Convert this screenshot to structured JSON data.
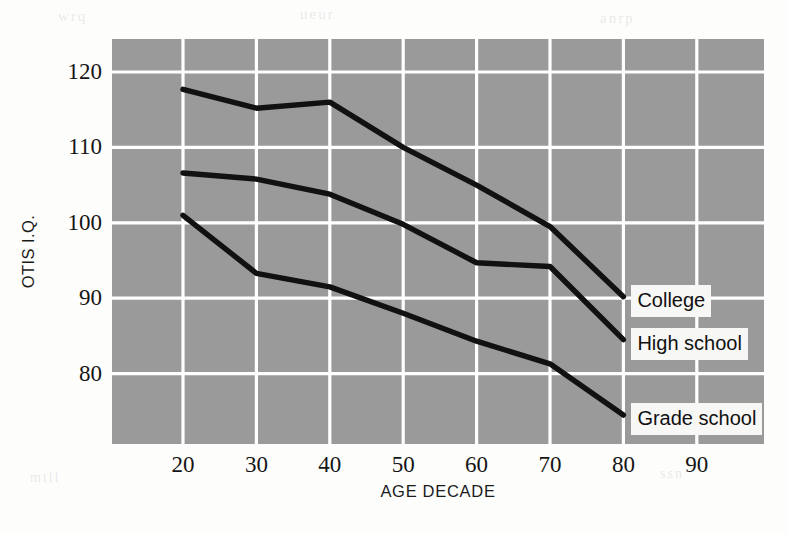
{
  "chart_data": {
    "type": "line",
    "title": "",
    "xlabel": "AGE DECADE",
    "ylabel": "OTIS I.Q.",
    "x": [
      20,
      30,
      40,
      50,
      60,
      70,
      80
    ],
    "xticks": [
      20,
      30,
      40,
      50,
      60,
      70,
      80,
      90
    ],
    "yticks": [
      80,
      90,
      100,
      110,
      120
    ],
    "xlim": [
      15,
      100
    ],
    "ylim": [
      70,
      125
    ],
    "grid": true,
    "legend_position": "right-inline-end-labels",
    "plot_background": "#9a9a9a",
    "grid_color": "#ffffff",
    "line_color": "#111111",
    "series": [
      {
        "name": "College",
        "values": [
          117.7,
          115.2,
          116.0,
          110.0,
          105.0,
          99.5,
          90.2
        ]
      },
      {
        "name": "High school",
        "values": [
          106.6,
          105.8,
          103.8,
          99.8,
          94.7,
          94.2,
          84.5
        ]
      },
      {
        "name": "Grade school",
        "values": [
          101.0,
          93.3,
          91.5,
          88.0,
          84.3,
          81.3,
          74.5
        ]
      }
    ]
  },
  "axis": {
    "y_title": "OTIS I.Q.",
    "x_title": "AGE DECADE",
    "y_tick_labels": [
      "120",
      "110",
      "100",
      "90",
      "80"
    ],
    "x_tick_labels": [
      "20",
      "30",
      "40",
      "50",
      "60",
      "70",
      "80",
      "90"
    ]
  },
  "series_labels": [
    {
      "text": "College",
      "value": 90.2
    },
    {
      "text": "High school",
      "value": 84.5
    },
    {
      "text": "Grade school",
      "value": 74.5
    }
  ],
  "ghost_text": {
    "top_left": "wrq",
    "top_mid": "ueur",
    "top_right": "anrp",
    "bottom_left": "mtll",
    "bottom_right": "ssn"
  }
}
